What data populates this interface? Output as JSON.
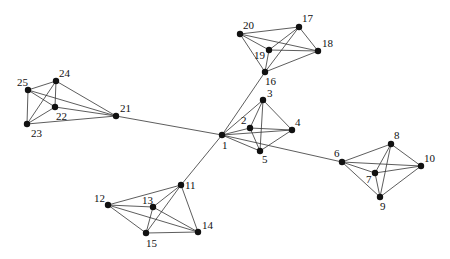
{
  "diagram": {
    "type": "network-graph",
    "colors": {
      "background": "#ffffff",
      "node": "#111111",
      "edge": "#333333",
      "label": "#111111"
    },
    "nodes": [
      {
        "id": "1",
        "x": 222,
        "y": 135,
        "lx": 222,
        "ly": 149
      },
      {
        "id": "2",
        "x": 250,
        "y": 128,
        "lx": 241,
        "ly": 124
      },
      {
        "id": "3",
        "x": 263,
        "y": 100,
        "lx": 267,
        "ly": 97
      },
      {
        "id": "4",
        "x": 292,
        "y": 130,
        "lx": 295,
        "ly": 126
      },
      {
        "id": "5",
        "x": 260,
        "y": 151,
        "lx": 262,
        "ly": 163
      },
      {
        "id": "6",
        "x": 342,
        "y": 162,
        "lx": 334,
        "ly": 157
      },
      {
        "id": "7",
        "x": 375,
        "y": 173,
        "lx": 366,
        "ly": 183
      },
      {
        "id": "8",
        "x": 391,
        "y": 144,
        "lx": 394,
        "ly": 139
      },
      {
        "id": "9",
        "x": 380,
        "y": 197,
        "lx": 380,
        "ly": 210
      },
      {
        "id": "10",
        "x": 421,
        "y": 166,
        "lx": 424,
        "ly": 162
      },
      {
        "id": "11",
        "x": 181,
        "y": 185,
        "lx": 185,
        "ly": 189
      },
      {
        "id": "12",
        "x": 108,
        "y": 205,
        "lx": 94,
        "ly": 202
      },
      {
        "id": "13",
        "x": 153,
        "y": 207,
        "lx": 142,
        "ly": 204
      },
      {
        "id": "14",
        "x": 198,
        "y": 232,
        "lx": 202,
        "ly": 229
      },
      {
        "id": "15",
        "x": 146,
        "y": 233,
        "lx": 146,
        "ly": 247
      },
      {
        "id": "16",
        "x": 265,
        "y": 72,
        "lx": 265,
        "ly": 85
      },
      {
        "id": "17",
        "x": 299,
        "y": 27,
        "lx": 302,
        "ly": 22
      },
      {
        "id": "18",
        "x": 318,
        "y": 51,
        "lx": 322,
        "ly": 47
      },
      {
        "id": "19",
        "x": 269,
        "y": 50,
        "lx": 254,
        "ly": 59
      },
      {
        "id": "20",
        "x": 240,
        "y": 34,
        "lx": 243,
        "ly": 29
      },
      {
        "id": "21",
        "x": 116,
        "y": 116,
        "lx": 120,
        "ly": 112
      },
      {
        "id": "22",
        "x": 55,
        "y": 107,
        "lx": 56,
        "ly": 120
      },
      {
        "id": "23",
        "x": 27,
        "y": 124,
        "lx": 31,
        "ly": 137
      },
      {
        "id": "24",
        "x": 56,
        "y": 81,
        "lx": 59,
        "ly": 77
      },
      {
        "id": "25",
        "x": 28,
        "y": 90,
        "lx": 17,
        "ly": 86
      }
    ],
    "edges": [
      [
        "1",
        "2"
      ],
      [
        "1",
        "3"
      ],
      [
        "1",
        "4"
      ],
      [
        "1",
        "5"
      ],
      [
        "2",
        "3"
      ],
      [
        "2",
        "4"
      ],
      [
        "2",
        "5"
      ],
      [
        "3",
        "4"
      ],
      [
        "3",
        "5"
      ],
      [
        "4",
        "5"
      ],
      [
        "1",
        "16"
      ],
      [
        "1",
        "6"
      ],
      [
        "1",
        "11"
      ],
      [
        "1",
        "21"
      ],
      [
        "16",
        "17"
      ],
      [
        "16",
        "18"
      ],
      [
        "16",
        "19"
      ],
      [
        "16",
        "20"
      ],
      [
        "17",
        "18"
      ],
      [
        "17",
        "19"
      ],
      [
        "17",
        "20"
      ],
      [
        "18",
        "19"
      ],
      [
        "18",
        "20"
      ],
      [
        "19",
        "20"
      ],
      [
        "6",
        "7"
      ],
      [
        "6",
        "8"
      ],
      [
        "6",
        "9"
      ],
      [
        "6",
        "10"
      ],
      [
        "7",
        "8"
      ],
      [
        "7",
        "9"
      ],
      [
        "7",
        "10"
      ],
      [
        "8",
        "9"
      ],
      [
        "8",
        "10"
      ],
      [
        "9",
        "10"
      ],
      [
        "11",
        "12"
      ],
      [
        "11",
        "13"
      ],
      [
        "11",
        "14"
      ],
      [
        "11",
        "15"
      ],
      [
        "12",
        "13"
      ],
      [
        "12",
        "14"
      ],
      [
        "12",
        "15"
      ],
      [
        "13",
        "14"
      ],
      [
        "13",
        "15"
      ],
      [
        "14",
        "15"
      ],
      [
        "21",
        "22"
      ],
      [
        "21",
        "23"
      ],
      [
        "21",
        "24"
      ],
      [
        "21",
        "25"
      ],
      [
        "22",
        "23"
      ],
      [
        "22",
        "24"
      ],
      [
        "22",
        "25"
      ],
      [
        "23",
        "24"
      ],
      [
        "23",
        "25"
      ],
      [
        "24",
        "25"
      ]
    ]
  }
}
